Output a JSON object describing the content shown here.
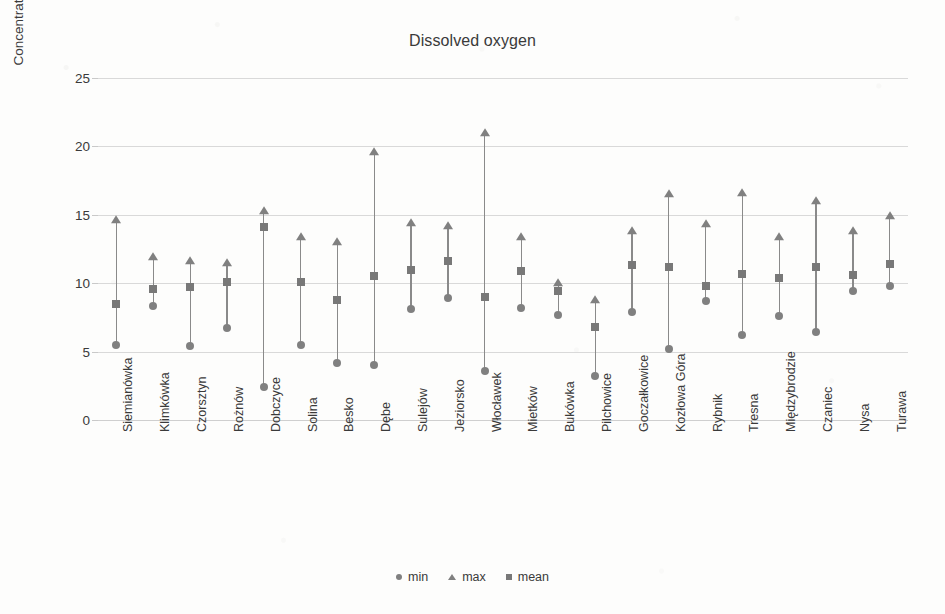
{
  "chart_data": {
    "type": "scatter",
    "title": "Dissolved oxygen",
    "xlabel": "",
    "ylabel": "Concentration [mg O2/L]",
    "ylabel_parts": {
      "prefix": "Concentration [mg O",
      "sub": "2",
      "suffix": "/L]"
    },
    "ylim": [
      0,
      25
    ],
    "ytick_values": [
      25,
      20,
      15,
      10,
      5,
      0
    ],
    "ytick_labels": [
      "25",
      "20",
      "15",
      "10",
      "5",
      "0"
    ],
    "grid": true,
    "legend_position": "bottom",
    "categories": [
      "Siemianówka",
      "Klimkówka",
      "Czorsztyn",
      "Rożnów",
      "Dobczyce",
      "Solina",
      "Besko",
      "Dębe",
      "Sulejów",
      "Jeziorsko",
      "Włocławek",
      "Mietków",
      "Bukówka",
      "Pilchowice",
      "Goczałkowice",
      "Kozłowa Góra",
      "Rybnik",
      "Tresna",
      "Międzybrodzie",
      "Czaniec",
      "Nysa",
      "Turawa"
    ],
    "series": [
      {
        "name": "min",
        "marker": "circle",
        "color": "#808080",
        "values": [
          5.5,
          8.3,
          5.4,
          6.7,
          2.4,
          5.5,
          4.2,
          4.0,
          8.1,
          8.9,
          3.6,
          8.2,
          7.7,
          3.2,
          7.9,
          5.2,
          8.7,
          6.2,
          7.6,
          6.4,
          9.4,
          9.8
        ]
      },
      {
        "name": "max",
        "marker": "triangle",
        "color": "#808080",
        "values": [
          14.6,
          11.9,
          11.6,
          11.5,
          15.3,
          13.4,
          13.0,
          19.6,
          14.4,
          14.2,
          21.0,
          13.4,
          10.0,
          8.8,
          13.8,
          16.5,
          14.3,
          16.6,
          13.4,
          16.0,
          13.8,
          14.9
        ]
      },
      {
        "name": "mean",
        "marker": "square",
        "color": "#787878",
        "values": [
          8.5,
          9.6,
          9.7,
          10.1,
          14.1,
          10.1,
          8.8,
          10.5,
          11.0,
          11.6,
          9.0,
          10.9,
          9.4,
          6.8,
          11.3,
          11.2,
          9.8,
          10.7,
          10.4,
          11.2,
          10.6,
          11.4
        ]
      }
    ]
  },
  "legend": {
    "items": [
      {
        "label": "min"
      },
      {
        "label": "max"
      },
      {
        "label": "mean"
      }
    ]
  }
}
